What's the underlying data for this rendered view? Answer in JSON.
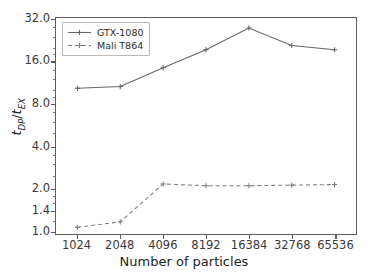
{
  "chart_data": {
    "type": "line",
    "title": "",
    "xlabel": "Number of particles",
    "ylabel": "t_DP/t_EX",
    "ylabel_parts": {
      "num_base": "t",
      "num_sub": "DP",
      "den_base": "t",
      "den_sub": "EX",
      "sep": "/"
    },
    "categories": [
      "1024",
      "2048",
      "4096",
      "8192",
      "16384",
      "32768",
      "65536"
    ],
    "x_tick_labels": [
      "1024",
      "2048",
      "4096",
      "8192",
      "16384",
      "32768",
      "65536"
    ],
    "y_tick_labels": [
      "1.0",
      "1.4",
      "2.0",
      "4.0",
      "8.0",
      "16.0",
      "32.0"
    ],
    "y_tick_values": [
      1.0,
      1.4,
      2.0,
      4.0,
      8.0,
      16.0,
      32.0
    ],
    "yscale": "log",
    "ylim": [
      0.95,
      33.0
    ],
    "grid": false,
    "legend_position": "upper left",
    "series": [
      {
        "name": "GTX-1080",
        "values": [
          10.4,
          10.7,
          14.6,
          19.6,
          28.0,
          21.0,
          19.6
        ],
        "color": "#666666",
        "linestyle": "solid",
        "marker": "plus"
      },
      {
        "name": "Mali T864",
        "values": [
          1.06,
          1.16,
          2.16,
          2.1,
          2.1,
          2.12,
          2.14
        ],
        "color": "#808080",
        "linestyle": "dashed",
        "marker": "plus"
      }
    ]
  },
  "figure": {
    "background": "#ffffff",
    "axis_color": "#5a5a5a",
    "text_color": "#1e1e1e"
  }
}
